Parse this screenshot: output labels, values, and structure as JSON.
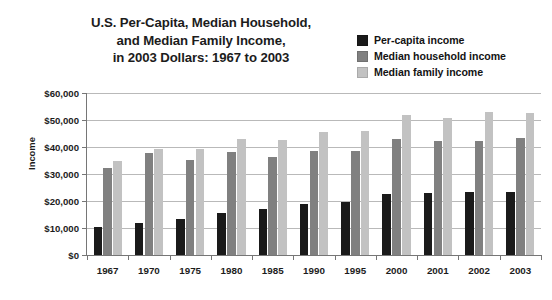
{
  "chart_data": {
    "type": "bar",
    "title_lines": [
      "U.S. Per-Capita, Median Household,",
      "and Median Family Income,",
      "in 2003 Dollars: 1967 to 2003"
    ],
    "xlabel": "",
    "ylabel": "Income",
    "ylim": [
      0,
      60000
    ],
    "ytick_values": [
      0,
      10000,
      20000,
      30000,
      40000,
      50000,
      60000
    ],
    "ytick_labels": [
      "$0",
      "$10,000",
      "$20,000",
      "$30,000",
      "$40,000",
      "$50,000",
      "$60,000"
    ],
    "grid": true,
    "legend_position": "top-right",
    "categories": [
      "1967",
      "1970",
      "1975",
      "1980",
      "1985",
      "1990",
      "1995",
      "2000",
      "2001",
      "2002",
      "2003"
    ],
    "series": [
      {
        "name": "Per-capita income",
        "color": "#1a1a1a",
        "values": [
          10400,
          12000,
          13200,
          15700,
          17000,
          18900,
          19800,
          22700,
          22800,
          23300,
          23200
        ]
      },
      {
        "name": "Median household income",
        "color": "#808080",
        "values": [
          32400,
          37800,
          35300,
          38300,
          36400,
          38400,
          38500,
          42900,
          42200,
          42400,
          43300
        ]
      },
      {
        "name": "Median family income",
        "color": "#c2c2c2",
        "values": [
          34900,
          39100,
          39300,
          42800,
          42500,
          45700,
          45900,
          51800,
          50900,
          53100,
          52700
        ]
      }
    ]
  }
}
